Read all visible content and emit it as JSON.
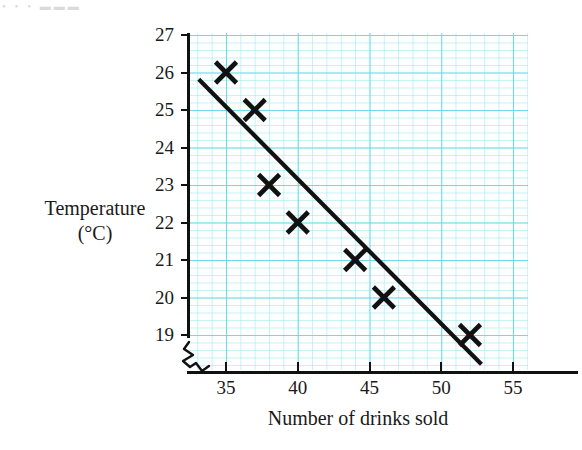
{
  "artifact_text": "•  •   • ▬▬▬",
  "chart_data": {
    "type": "scatter",
    "title": "",
    "xlabel": "Number of drinks sold",
    "ylabel": "Temperature",
    "ylabel_units": "(°C)",
    "xlim": [
      33,
      57
    ],
    "ylim": [
      18.2,
      27.1
    ],
    "x_ticks": [
      35,
      40,
      45,
      50,
      55
    ],
    "y_ticks": [
      19,
      20,
      21,
      22,
      23,
      24,
      25,
      26,
      27
    ],
    "x_tick_labels": [
      "35",
      "40",
      "45",
      "50",
      "55"
    ],
    "y_tick_labels": [
      "19",
      "20",
      "21",
      "22",
      "23",
      "24",
      "25",
      "26",
      "27"
    ],
    "grid": true,
    "grid_major_color": "#5dd6e2",
    "grid_minor_color": "#a0e8f0",
    "grid_major_step_x": 5,
    "grid_major_step_y": 1,
    "grid_minor_divisions": 5,
    "axis_break_y": true,
    "legend": "none",
    "marker": "x",
    "marker_color": "#111111",
    "points": [
      {
        "x": 35,
        "y": 26
      },
      {
        "x": 37,
        "y": 25
      },
      {
        "x": 38,
        "y": 23
      },
      {
        "x": 40,
        "y": 22
      },
      {
        "x": 44,
        "y": 21
      },
      {
        "x": 46,
        "y": 20
      },
      {
        "x": 52,
        "y": 19
      }
    ],
    "series": [
      {
        "name": "Temperature vs drinks sold",
        "x": [
          35,
          37,
          38,
          40,
          44,
          46,
          52
        ],
        "values": [
          26,
          25,
          23,
          22,
          21,
          20,
          19
        ]
      }
    ],
    "trend_line": {
      "label": "line of best fit",
      "color": "#111111",
      "x_start": 33.1,
      "y_start": 25.82,
      "x_end": 52.8,
      "y_end": 18.22
    }
  }
}
